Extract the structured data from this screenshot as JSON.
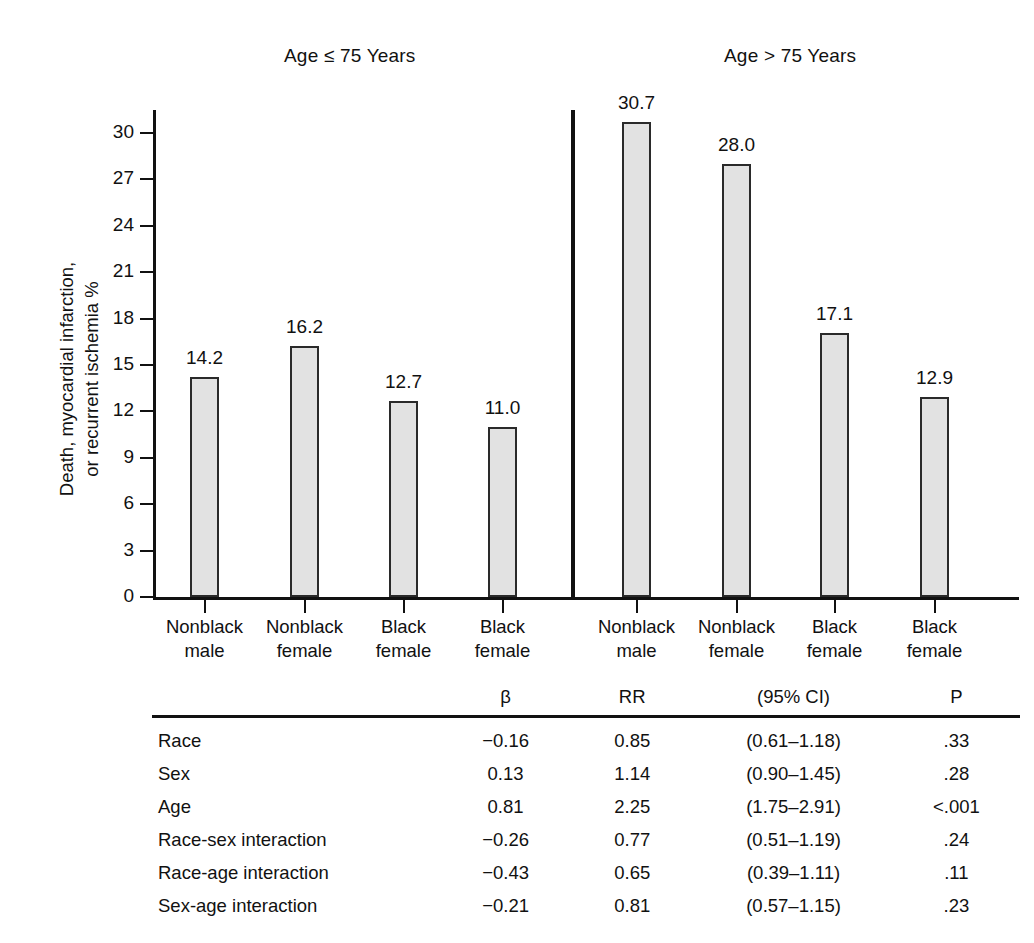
{
  "panels": [
    {
      "title": "Age ≤ 75 Years"
    },
    {
      "title": "Age > 75 Years"
    }
  ],
  "axis": {
    "y_title": "Death, myocardial infarction,\nor recurrent ischemia %",
    "y_ticks": [
      "0",
      "3",
      "6",
      "9",
      "12",
      "15",
      "18",
      "21",
      "24",
      "27",
      "30"
    ]
  },
  "categories": [
    "Nonblack\nmale",
    "Nonblack\nfemale",
    "Black\nfemale",
    "Black\nfemale"
  ],
  "bar_values": {
    "left": [
      "14.2",
      "16.2",
      "12.7",
      "11.0"
    ],
    "right": [
      "30.7",
      "28.0",
      "17.1",
      "12.9"
    ]
  },
  "table": {
    "headers": [
      "",
      "β",
      "RR",
      "(95% CI)",
      "P"
    ],
    "rows": [
      {
        "term": "Race",
        "beta": "−0.16",
        "rr": "0.85",
        "ci": "(0.61–1.18)",
        "p": ".33"
      },
      {
        "term": "Sex",
        "beta": "0.13",
        "rr": "1.14",
        "ci": "(0.90–1.45)",
        "p": ".28"
      },
      {
        "term": "Age",
        "beta": "0.81",
        "rr": "2.25",
        "ci": "(1.75–2.91)",
        "p": "<.001"
      },
      {
        "term": "Race-sex interaction",
        "beta": "−0.26",
        "rr": "0.77",
        "ci": "(0.51–1.19)",
        "p": ".24"
      },
      {
        "term": "Race-age interaction",
        "beta": "−0.43",
        "rr": "0.65",
        "ci": "(0.39–1.11)",
        "p": ".11"
      },
      {
        "term": "Sex-age interaction",
        "beta": "−0.21",
        "rr": "0.81",
        "ci": "(0.57–1.15)",
        "p": ".23"
      }
    ]
  },
  "colors": {
    "bar_fill": "#e2e2e2",
    "bar_stroke": "#2a2a2a",
    "axis": "#111111",
    "text": "#111111"
  },
  "chart_data": {
    "type": "bar",
    "title": "",
    "xlabel": "",
    "ylabel": "Death, myocardial infarction, or recurrent ischemia %",
    "ylim": [
      0,
      30
    ],
    "ytick_step": 3,
    "yticks": [
      0,
      3,
      6,
      9,
      12,
      15,
      18,
      21,
      24,
      27,
      30
    ],
    "grid": false,
    "legend": "none",
    "panels": [
      {
        "name": "Age ≤ 75 Years",
        "categories": [
          "Nonblack male",
          "Nonblack female",
          "Black female",
          "Black female"
        ],
        "values": [
          14.2,
          16.2,
          12.7,
          11.0
        ],
        "data_labels": [
          "14.2",
          "16.2",
          "12.7",
          "11.0"
        ]
      },
      {
        "name": "Age > 75 Years",
        "categories": [
          "Nonblack male",
          "Nonblack female",
          "Black female",
          "Black female"
        ],
        "values": [
          30.7,
          28.0,
          17.1,
          12.9
        ],
        "data_labels": [
          "30.7",
          "28.0",
          "17.1",
          "12.9"
        ]
      }
    ],
    "annotations": {
      "table": {
        "type": "table",
        "columns": [
          "",
          "β",
          "RR",
          "(95% CI)",
          "P"
        ],
        "rows": [
          [
            "Race",
            "−0.16",
            "0.85",
            "(0.61–1.18)",
            ".33"
          ],
          [
            "Sex",
            "0.13",
            "1.14",
            "(0.90–1.45)",
            ".28"
          ],
          [
            "Age",
            "0.81",
            "2.25",
            "(1.75–2.91)",
            "<.001"
          ],
          [
            "Race-sex interaction",
            "−0.26",
            "0.77",
            "(0.51–1.19)",
            ".24"
          ],
          [
            "Race-age interaction",
            "−0.43",
            "0.65",
            "(0.39–1.11)",
            ".11"
          ],
          [
            "Sex-age interaction",
            "−0.21",
            "0.81",
            "(0.57–1.15)",
            ".23"
          ]
        ]
      }
    }
  }
}
